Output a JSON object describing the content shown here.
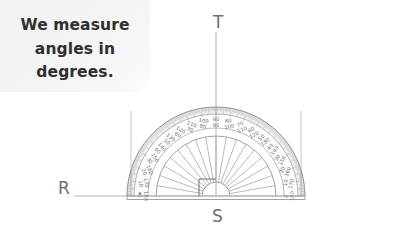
{
  "canvas": {
    "width": 402,
    "height": 242,
    "background": "#ffffff"
  },
  "speech_bubble": {
    "text": "We measure\nangles in\ndegrees.",
    "lines": [
      "We measure",
      "angles in",
      "degrees."
    ],
    "background": "#f3f3f4",
    "text_color": "#2f2f2f"
  },
  "labels": {
    "vertex_top": "T",
    "vertex_bottom": "S",
    "vertex_left": "R",
    "color": "#6f6f6f"
  },
  "protractor": {
    "center_x": 216,
    "center_y": 196,
    "outer_radius": 89,
    "inner_radius": 60,
    "hub_radius": 14,
    "baseline_left_x": 127,
    "baseline_right_x": 305,
    "line_color": "#8a8a8a",
    "tick_band_fill": "#e2e2e2",
    "degree_step": 10,
    "outer_scale_labels": [
      0,
      10,
      20,
      30,
      40,
      50,
      60,
      70,
      80,
      90,
      100,
      110,
      120,
      130,
      140,
      150,
      160,
      170,
      180
    ],
    "inner_scale_labels": [
      180,
      170,
      160,
      150,
      140,
      130,
      120,
      110,
      100,
      90,
      80,
      70,
      60,
      50,
      40,
      30,
      20,
      10,
      0
    ],
    "ray_step_degrees": 10,
    "right_angle_marker": {
      "at_degrees": 90,
      "size": 17,
      "side": "left"
    },
    "center_dot": true,
    "ray_T_extends_above": true,
    "ray_R_extends_left": true
  },
  "person": {
    "skin": "#9b9b9b",
    "hair": "#2b2b2b",
    "shirt": "#fbfbfb",
    "shirt_shade": "#ededed",
    "pants": "#1f1f1f",
    "eye_color": "#2b2b2b",
    "mouth_color": "#5a5a5a",
    "pose": "pointing-up-finger"
  }
}
